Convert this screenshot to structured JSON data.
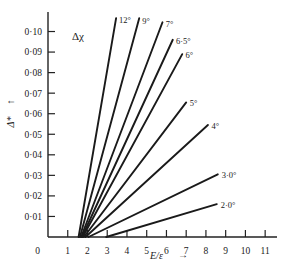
{
  "chart_data": {
    "type": "line",
    "title": "",
    "annotation": "Δχ",
    "xlabel": "E/ε",
    "xlabel_arrow": "→",
    "ylabel": "Δ*",
    "ylabel_arrow": "↑",
    "xlim": [
      0,
      11.6
    ],
    "ylim": [
      0,
      0.1095
    ],
    "grid": false,
    "legend_position": "inline-at-line-end",
    "xticks": [
      "0",
      "1",
      "2",
      "3",
      "4",
      "5",
      "6",
      "7",
      "8",
      "9",
      "10",
      "11"
    ],
    "xtick_values": [
      0,
      1,
      2,
      3,
      4,
      5,
      6,
      7,
      8,
      9,
      10,
      11
    ],
    "yticks": [
      "0",
      "0·01",
      "0·02",
      "0·03",
      "0·04",
      "0·05",
      "0·06",
      "0·07",
      "0·08",
      "0·09",
      "0·10"
    ],
    "ytick_values": [
      0,
      0.01,
      0.02,
      0.03,
      0.04,
      0.05,
      0.06,
      0.07,
      0.08,
      0.09,
      0.1
    ],
    "series": [
      {
        "name": "12°",
        "x": [
          1.55,
          3.45
        ],
        "y": [
          0.0,
          0.1065
        ],
        "label_x": 3.6,
        "label_y": 0.1055
      },
      {
        "name": "9°",
        "x": [
          1.62,
          4.62
        ],
        "y": [
          0.0,
          0.1065
        ],
        "label_x": 4.78,
        "label_y": 0.105
      },
      {
        "name": "7°",
        "x": [
          1.68,
          5.8
        ],
        "y": [
          0.0,
          0.1045
        ],
        "label_x": 5.96,
        "label_y": 0.1035
      },
      {
        "name": "6·5°",
        "x": [
          1.72,
          6.32
        ],
        "y": [
          0.0,
          0.096
        ],
        "label_x": 6.48,
        "label_y": 0.0955
      },
      {
        "name": "6°",
        "x": [
          1.76,
          6.8
        ],
        "y": [
          0.0,
          0.089
        ],
        "label_x": 6.96,
        "label_y": 0.0885
      },
      {
        "name": "5°",
        "x": [
          1.82,
          7.0
        ],
        "y": [
          0.0,
          0.0655
        ],
        "label_x": 7.18,
        "label_y": 0.065
      },
      {
        "name": "4°",
        "x": [
          1.9,
          8.1
        ],
        "y": [
          0.0,
          0.0545
        ],
        "label_x": 8.28,
        "label_y": 0.054
      },
      {
        "name": "3·0°",
        "x": [
          2.05,
          8.6
        ],
        "y": [
          0.0,
          0.0305
        ],
        "label_x": 8.8,
        "label_y": 0.03
      },
      {
        "name": "2·0°",
        "x": [
          2.95,
          8.55
        ],
        "y": [
          0.0,
          0.016
        ],
        "label_x": 8.75,
        "label_y": 0.0158
      }
    ]
  },
  "meta": {
    "accent_color": "#1a1a1a",
    "background_color": "#ffffff"
  }
}
